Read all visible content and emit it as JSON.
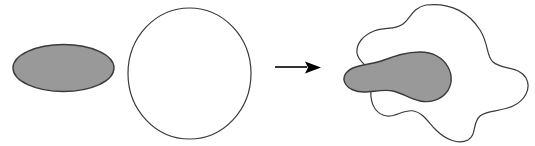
{
  "figure": {
    "background_color": "#ffffff",
    "width": 535,
    "height": 146,
    "stroke_color": "#3a3a3a",
    "fill_gray": "#999999",
    "arrow_color": "#000000"
  },
  "left_group": {
    "label": "before",
    "shapes": [
      {
        "name": "gray-ellipse",
        "kind": "ellipse",
        "fill": "#999999",
        "stroke": "#3a3a3a",
        "cx": 63.5,
        "cy": 68,
        "rx": 50.5,
        "ry": 23.5
      },
      {
        "name": "white-circle",
        "kind": "ellipse",
        "fill": "#ffffff",
        "stroke": "#3a3a3a",
        "cx": 189.5,
        "cy": 73.5,
        "rx": 61.5,
        "ry": 65.5
      }
    ]
  },
  "arrow": {
    "name": "transformation-arrow",
    "direction": "right",
    "color": "#000000",
    "x_start": 275,
    "x_end": 321,
    "y": 67,
    "shaft_width": 1.6,
    "head_length": 16,
    "head_half_height": 6
  },
  "right_group": {
    "label": "after",
    "shapes": [
      {
        "name": "deformed-white-blob",
        "kind": "blob",
        "fill": "#ffffff",
        "stroke": "#3a3a3a",
        "path": "M 426 5 C 452 2 470 14 480 30 C 489 44 486 56 493 62 C 502 70 519 66 526 78 C 532 89 524 101 513 106 C 500 112 487 110 480 116 C 472 123 477 135 468 140 C 458 145 445 139 436 130 C 428 122 423 113 414 111 C 404 109 396 117 387 116 C 377 115 372 106 371 97 C 370 88 374 80 371 73 C 368 65 358 62 357 53 C 356 43 364 35 374 31 C 385 27 395 30 403 24 C 411 18 412 8 426 5 Z"
      },
      {
        "name": "deformed-gray-blob",
        "kind": "blob",
        "fill": "#999999",
        "stroke": "#3a3a3a",
        "path": "M 420 52 C 433 52 443 58 448 67 C 453 76 452 86 446 93 C 440 100 430 103 420 101 C 410 99 402 93 393 91 C 383 89 373 92 364 92 C 356 92 348 89 345 83 C 342 77 346 71 353 68 C 362 64 374 64 384 60 C 395 56 406 52 420 52 Z"
      }
    ]
  },
  "legend": {
    "meaning": "An ellipse and a circle are deformed into irregular overlapping blobs"
  }
}
